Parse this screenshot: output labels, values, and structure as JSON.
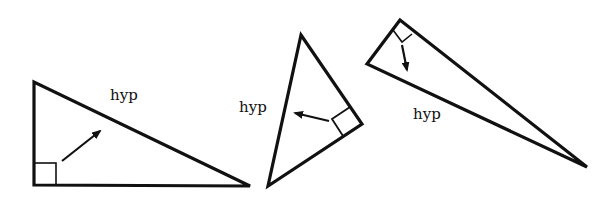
{
  "figure": {
    "stroke_color": "#111111",
    "background": "#ffffff",
    "triangles": [
      {
        "id": "triangle-1",
        "label": "hyp",
        "vertices": [
          [
            34,
            82
          ],
          [
            34,
            185
          ],
          [
            250,
            186
          ]
        ],
        "right_angle_at": [
          34,
          185
        ],
        "label_pos": [
          110,
          88
        ]
      },
      {
        "id": "triangle-2",
        "label": "hyp",
        "vertices": [
          [
            301,
            35
          ],
          [
            362,
            124
          ],
          [
            268,
            186
          ]
        ],
        "right_angle_at": [
          362,
          124
        ],
        "label_pos": [
          239,
          100
        ]
      },
      {
        "id": "triangle-3",
        "label": "hyp",
        "vertices": [
          [
            400,
            20
          ],
          [
            367,
            64
          ],
          [
            587,
            167
          ]
        ],
        "right_angle_at": [
          400,
          20
        ],
        "label_pos": [
          413,
          107
        ]
      }
    ]
  }
}
